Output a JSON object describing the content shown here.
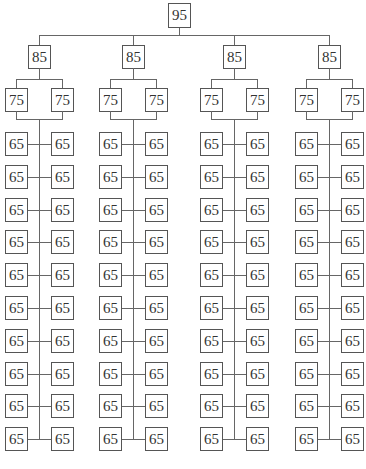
{
  "diagram": {
    "type": "tree",
    "root": {
      "label": "95"
    },
    "branches": [
      {
        "label": "85",
        "children": [
          {
            "label": "75"
          },
          {
            "label": "75"
          }
        ],
        "leaf_rows": [
          [
            "65",
            "65"
          ],
          [
            "65",
            "65"
          ],
          [
            "65",
            "65"
          ],
          [
            "65",
            "65"
          ],
          [
            "65",
            "65"
          ],
          [
            "65",
            "65"
          ],
          [
            "65",
            "65"
          ],
          [
            "65",
            "65"
          ],
          [
            "65",
            "65"
          ],
          [
            "65",
            "65"
          ]
        ]
      },
      {
        "label": "85",
        "children": [
          {
            "label": "75"
          },
          {
            "label": "75"
          }
        ],
        "leaf_rows": [
          [
            "65",
            "65"
          ],
          [
            "65",
            "65"
          ],
          [
            "65",
            "65"
          ],
          [
            "65",
            "65"
          ],
          [
            "65",
            "65"
          ],
          [
            "65",
            "65"
          ],
          [
            "65",
            "65"
          ],
          [
            "65",
            "65"
          ],
          [
            "65",
            "65"
          ],
          [
            "65",
            "65"
          ]
        ]
      },
      {
        "label": "85",
        "children": [
          {
            "label": "75"
          },
          {
            "label": "75"
          }
        ],
        "leaf_rows": [
          [
            "65",
            "65"
          ],
          [
            "65",
            "65"
          ],
          [
            "65",
            "65"
          ],
          [
            "65",
            "65"
          ],
          [
            "65",
            "65"
          ],
          [
            "65",
            "65"
          ],
          [
            "65",
            "65"
          ],
          [
            "65",
            "65"
          ],
          [
            "65",
            "65"
          ],
          [
            "65",
            "65"
          ]
        ]
      },
      {
        "label": "85",
        "children": [
          {
            "label": "75"
          },
          {
            "label": "75"
          }
        ],
        "leaf_rows": [
          [
            "65",
            "65"
          ],
          [
            "65",
            "65"
          ],
          [
            "65",
            "65"
          ],
          [
            "65",
            "65"
          ],
          [
            "65",
            "65"
          ],
          [
            "65",
            "65"
          ],
          [
            "65",
            "65"
          ],
          [
            "65",
            "65"
          ],
          [
            "65",
            "65"
          ],
          [
            "65",
            "65"
          ]
        ]
      }
    ]
  }
}
